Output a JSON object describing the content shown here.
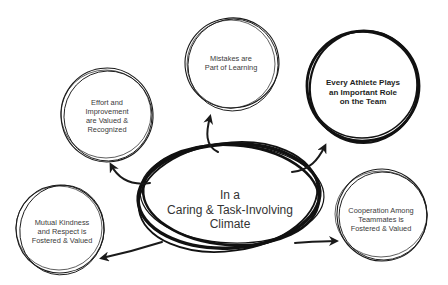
{
  "diagram": {
    "center": {
      "lines": [
        "In a",
        "Caring & Task-Involving",
        "Climate"
      ]
    },
    "nodes": [
      {
        "id": "effort",
        "lines": [
          "Effort and",
          "Improvement",
          "are Valued &",
          "Recognized"
        ]
      },
      {
        "id": "mistakes",
        "lines": [
          "Mistakes are",
          "Part of Learning"
        ]
      },
      {
        "id": "every-athlete",
        "lines": [
          "Every Athlete Plays",
          "an Important Role",
          "on the Team"
        ],
        "emphasis": "bold"
      },
      {
        "id": "kindness",
        "lines": [
          "Mutual Kindness",
          "and Respect is",
          "Fostered & Valued"
        ]
      },
      {
        "id": "cooperation",
        "lines": [
          "Cooperation Among",
          "Teammates is",
          "Fostered & Valued"
        ]
      }
    ],
    "colors": {
      "ink": "#1a1a1a",
      "text": "#3a3a3a",
      "background": "#ffffff"
    }
  }
}
